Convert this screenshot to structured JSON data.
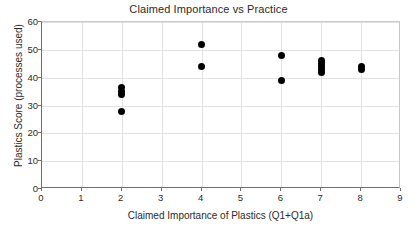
{
  "chart_data": {
    "type": "scatter",
    "title": "Claimed Importance vs Practice",
    "xlabel": "Claimed Importance of Plastics (Q1+Q1a)",
    "ylabel": "Plastics Score (processes used)",
    "xlim": [
      0,
      9
    ],
    "ylim": [
      0,
      60
    ],
    "xticks": [
      0,
      1,
      2,
      3,
      4,
      5,
      6,
      7,
      8,
      9
    ],
    "yticks": [
      0,
      10,
      20,
      30,
      40,
      50,
      60
    ],
    "grid": true,
    "legend": false,
    "marker": {
      "shape": "circle",
      "color": "#000000",
      "size_px": 7
    },
    "series": [
      {
        "name": "respondents",
        "points": [
          {
            "x": 2,
            "y": 36.5
          },
          {
            "x": 2,
            "y": 35.0
          },
          {
            "x": 2,
            "y": 34.0
          },
          {
            "x": 2,
            "y": 28.0
          },
          {
            "x": 4,
            "y": 52.0
          },
          {
            "x": 4,
            "y": 44.0
          },
          {
            "x": 6,
            "y": 48.0
          },
          {
            "x": 6,
            "y": 39.0
          },
          {
            "x": 7,
            "y": 46.0
          },
          {
            "x": 7,
            "y": 45.0
          },
          {
            "x": 7,
            "y": 44.0
          },
          {
            "x": 7,
            "y": 43.0
          },
          {
            "x": 7,
            "y": 42.0
          },
          {
            "x": 8,
            "y": 44.0
          },
          {
            "x": 8,
            "y": 43.0
          }
        ]
      }
    ]
  },
  "colors": {
    "marker": "#000000",
    "grid": "#e2e2e2",
    "axis": "#6f6f6f",
    "text": "#2b2b2b",
    "background": "#ffffff"
  }
}
